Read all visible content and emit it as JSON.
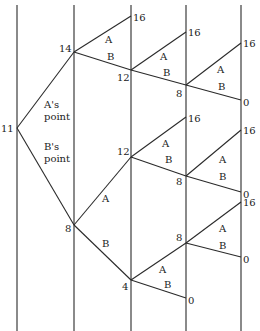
{
  "diagram": {
    "type": "binary-tree",
    "line_color": "#2a2a2a",
    "columns_x": [
      17,
      74,
      131,
      186,
      241
    ],
    "root_label": "11",
    "root_annotations": {
      "upper": [
        "A's",
        "point"
      ],
      "lower": [
        "B's",
        "point"
      ]
    },
    "nodes": [
      {
        "id": "n0",
        "value": "11",
        "x": 17,
        "y": 128
      },
      {
        "id": "n1",
        "value": "14",
        "x": 74,
        "y": 52
      },
      {
        "id": "n2",
        "value": "8",
        "x": 74,
        "y": 225
      },
      {
        "id": "n3",
        "value": "16",
        "x": 131,
        "y": 16
      },
      {
        "id": "n4",
        "value": "12",
        "x": 131,
        "y": 70
      },
      {
        "id": "n5",
        "value": "12",
        "x": 131,
        "y": 157
      },
      {
        "id": "n6",
        "value": "4",
        "x": 131,
        "y": 280
      },
      {
        "id": "n7",
        "value": "16",
        "x": 186,
        "y": 32
      },
      {
        "id": "n8",
        "value": "8",
        "x": 186,
        "y": 85
      },
      {
        "id": "n9",
        "value": "16",
        "x": 186,
        "y": 117
      },
      {
        "id": "n10",
        "value": "8",
        "x": 186,
        "y": 176
      },
      {
        "id": "n11",
        "value": "8",
        "x": 186,
        "y": 243
      },
      {
        "id": "n12",
        "value": "0",
        "x": 186,
        "y": 298
      },
      {
        "id": "n13",
        "value": "16",
        "x": 241,
        "y": 43
      },
      {
        "id": "n14",
        "value": "0",
        "x": 241,
        "y": 100
      },
      {
        "id": "n15",
        "value": "16",
        "x": 241,
        "y": 130
      },
      {
        "id": "n16",
        "value": "0",
        "x": 241,
        "y": 192
      },
      {
        "id": "n17",
        "value": "16",
        "x": 241,
        "y": 202
      },
      {
        "id": "n18",
        "value": "0",
        "x": 241,
        "y": 257
      }
    ],
    "edges": [
      {
        "from": "n0",
        "to": "n1",
        "label": ""
      },
      {
        "from": "n0",
        "to": "n2",
        "label": ""
      },
      {
        "from": "n1",
        "to": "n3",
        "label": "A"
      },
      {
        "from": "n1",
        "to": "n4",
        "label": "B"
      },
      {
        "from": "n2",
        "to": "n5",
        "label": "A"
      },
      {
        "from": "n2",
        "to": "n6",
        "label": "B"
      },
      {
        "from": "n4",
        "to": "n7",
        "label": "A"
      },
      {
        "from": "n4",
        "to": "n8",
        "label": "B"
      },
      {
        "from": "n5",
        "to": "n9",
        "label": "A"
      },
      {
        "from": "n5",
        "to": "n10",
        "label": "B"
      },
      {
        "from": "n6",
        "to": "n11",
        "label": "A"
      },
      {
        "from": "n6",
        "to": "n12",
        "label": "B"
      },
      {
        "from": "n8",
        "to": "n13",
        "label": "A"
      },
      {
        "from": "n8",
        "to": "n14",
        "label": "B"
      },
      {
        "from": "n10",
        "to": "n15",
        "label": "A"
      },
      {
        "from": "n10",
        "to": "n16",
        "label": "B"
      },
      {
        "from": "n11",
        "to": "n17",
        "label": "A"
      },
      {
        "from": "n11",
        "to": "n18",
        "label": "B"
      }
    ],
    "branch_labels": {
      "a": "A",
      "b": "B"
    }
  }
}
